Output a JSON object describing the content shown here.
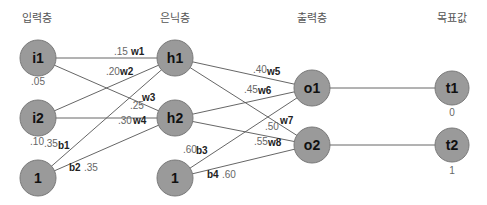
{
  "layers": {
    "input": "입력층",
    "hidden": "은닉층",
    "output": "출력층",
    "target": "목표값"
  },
  "nodes": {
    "i1": {
      "label": "i1",
      "value": ".05"
    },
    "i2": {
      "label": "i2",
      "value": ".10"
    },
    "bias1": {
      "label": "1"
    },
    "h1": {
      "label": "h1"
    },
    "h2": {
      "label": "h2"
    },
    "bias2": {
      "label": "1"
    },
    "o1": {
      "label": "o1"
    },
    "o2": {
      "label": "o2"
    },
    "t1": {
      "label": "t1",
      "value": "0"
    },
    "t2": {
      "label": "t2",
      "value": "1"
    }
  },
  "weights": {
    "w1": {
      "name": "w1",
      "value": ".15"
    },
    "w2": {
      "name": "w2",
      "value": ".20"
    },
    "w3": {
      "name": "w3",
      "value": ".25"
    },
    "w4": {
      "name": "w4",
      "value": ".30"
    },
    "w5": {
      "name": "w5",
      "value": ".40"
    },
    "w6": {
      "name": "w6",
      "value": ".45"
    },
    "w7": {
      "name": "w7",
      "value": ".50"
    },
    "w8": {
      "name": "w8",
      "value": ".55"
    },
    "b1": {
      "name": "b1",
      "value": ".35"
    },
    "b2": {
      "name": "b2",
      "value": ".35"
    },
    "b3": {
      "name": "b3",
      "value": ".60"
    },
    "b4": {
      "name": "b4",
      "value": ".60"
    }
  },
  "colors": {
    "node_fill": "#9a9a9a",
    "edge": "#555555"
  }
}
